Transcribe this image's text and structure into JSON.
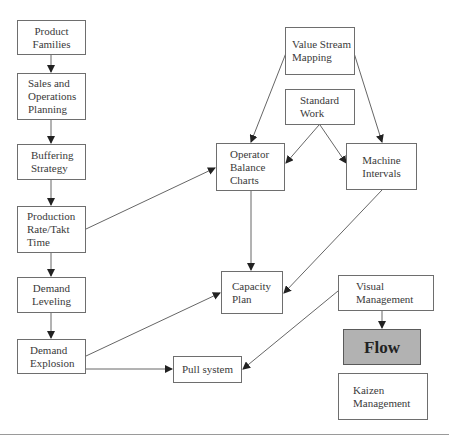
{
  "diagram": {
    "type": "flowchart",
    "nodes": [
      {
        "id": "product_families",
        "label": "Product\nFamilies"
      },
      {
        "id": "sop",
        "label": "Sales and\nOperations\nPlanning"
      },
      {
        "id": "buffering",
        "label": "Buffering\nStrategy"
      },
      {
        "id": "production_rate",
        "label": "Production\nRate/Takt\nTime"
      },
      {
        "id": "demand_leveling",
        "label": "Demand\nLeveling"
      },
      {
        "id": "demand_explosion",
        "label": "Demand\nExplosion"
      },
      {
        "id": "value_stream",
        "label": "Value Stream\nMapping"
      },
      {
        "id": "standard_work",
        "label": "Standard\nWork"
      },
      {
        "id": "operator_balance",
        "label": "Operator\nBalance\nCharts"
      },
      {
        "id": "machine_intervals",
        "label": "Machine\nIntervals"
      },
      {
        "id": "capacity_plan",
        "label": "Capacity\nPlan"
      },
      {
        "id": "pull_system",
        "label": "Pull system"
      },
      {
        "id": "visual_management",
        "label": "Visual\nManagement"
      },
      {
        "id": "flow",
        "label": "Flow",
        "fill": "#b2b2b2"
      },
      {
        "id": "kaizen",
        "label": "Kaizen\nManagement"
      }
    ],
    "edges": [
      {
        "from": "product_families",
        "to": "sop"
      },
      {
        "from": "sop",
        "to": "buffering"
      },
      {
        "from": "buffering",
        "to": "production_rate"
      },
      {
        "from": "production_rate",
        "to": "demand_leveling"
      },
      {
        "from": "demand_leveling",
        "to": "demand_explosion"
      },
      {
        "from": "production_rate",
        "to": "operator_balance"
      },
      {
        "from": "value_stream",
        "to": "operator_balance"
      },
      {
        "from": "value_stream",
        "to": "machine_intervals"
      },
      {
        "from": "standard_work",
        "to": "operator_balance"
      },
      {
        "from": "standard_work",
        "to": "machine_intervals"
      },
      {
        "from": "operator_balance",
        "to": "capacity_plan"
      },
      {
        "from": "machine_intervals",
        "to": "capacity_plan"
      },
      {
        "from": "demand_explosion",
        "to": "capacity_plan"
      },
      {
        "from": "demand_explosion",
        "to": "pull_system"
      },
      {
        "from": "visual_management",
        "to": "pull_system"
      },
      {
        "from": "visual_management",
        "to": "flow"
      }
    ]
  }
}
